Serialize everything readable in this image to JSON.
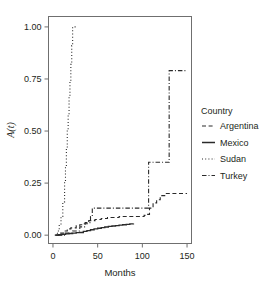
{
  "chart_data": {
    "type": "line",
    "title": "",
    "xlabel": "Months",
    "ylabel": "A(t)",
    "xlim": [
      -5,
      155
    ],
    "ylim": [
      -0.04,
      1.05
    ],
    "xticks": [
      0,
      50,
      100,
      150
    ],
    "xtick_labels": [
      "0",
      "50",
      "100",
      "150"
    ],
    "yticks": [
      0.0,
      0.25,
      0.5,
      0.75,
      1.0
    ],
    "ytick_labels": [
      "0.00",
      "0.25",
      "0.50",
      "0.75",
      "1.00"
    ],
    "grid": false,
    "legend_position": "right",
    "legend_title": "Country",
    "step_type": "post",
    "series": [
      {
        "name": "Argentina",
        "dash": "dashed",
        "color": "#2a2a2a",
        "width": 1.1,
        "x": [
          3,
          8,
          12,
          16,
          20,
          26,
          30,
          34,
          40,
          47,
          54,
          61,
          68,
          74,
          80,
          88,
          96,
          102,
          106,
          108,
          112,
          116,
          120,
          126,
          134,
          142,
          150
        ],
        "y": [
          0.0,
          0.01,
          0.02,
          0.03,
          0.035,
          0.045,
          0.05,
          0.055,
          0.07,
          0.075,
          0.08,
          0.085,
          0.085,
          0.09,
          0.09,
          0.09,
          0.09,
          0.095,
          0.1,
          0.13,
          0.155,
          0.17,
          0.19,
          0.2,
          0.2,
          0.2,
          0.2
        ]
      },
      {
        "name": "Mexico",
        "dash": "solid",
        "color": "#2a2a2a",
        "width": 1.4,
        "x": [
          2,
          6,
          10,
          14,
          18,
          22,
          26,
          30,
          34,
          38,
          42,
          46,
          50,
          54,
          58,
          62,
          66,
          70,
          74,
          78,
          82,
          86,
          90
        ],
        "y": [
          0.0,
          0.002,
          0.004,
          0.006,
          0.008,
          0.01,
          0.012,
          0.013,
          0.018,
          0.022,
          0.026,
          0.03,
          0.033,
          0.036,
          0.039,
          0.042,
          0.044,
          0.046,
          0.048,
          0.05,
          0.052,
          0.054,
          0.056
        ]
      },
      {
        "name": "Sudan",
        "dash": "dotted",
        "color": "#2a2a2a",
        "width": 1.1,
        "x": [
          3,
          5,
          7,
          9,
          11,
          13,
          14,
          15,
          16,
          17,
          18,
          19,
          20,
          21,
          22,
          26
        ],
        "y": [
          0.0,
          0.02,
          0.05,
          0.09,
          0.16,
          0.26,
          0.33,
          0.42,
          0.5,
          0.58,
          0.66,
          0.74,
          0.82,
          0.91,
          1.0,
          1.0
        ]
      },
      {
        "name": "Turkey",
        "dash": "dashdot",
        "color": "#2a2a2a",
        "width": 1.1,
        "x": [
          5,
          14,
          22,
          30,
          36,
          42,
          44,
          60,
          80,
          100,
          106,
          107,
          118,
          126,
          130,
          140,
          150
        ],
        "y": [
          0.0,
          0.01,
          0.02,
          0.04,
          0.06,
          0.09,
          0.13,
          0.13,
          0.13,
          0.13,
          0.13,
          0.35,
          0.35,
          0.35,
          0.79,
          0.79,
          0.79
        ]
      }
    ]
  },
  "legend": {
    "title": "Country",
    "entries": [
      {
        "label": "Argentina",
        "dash": "dashed"
      },
      {
        "label": "Mexico",
        "dash": "solid"
      },
      {
        "label": "Sudan",
        "dash": "dotted"
      },
      {
        "label": "Turkey",
        "dash": "dashdot"
      }
    ]
  },
  "axes": {
    "x_title": "Months",
    "y_title": "A(t)"
  }
}
